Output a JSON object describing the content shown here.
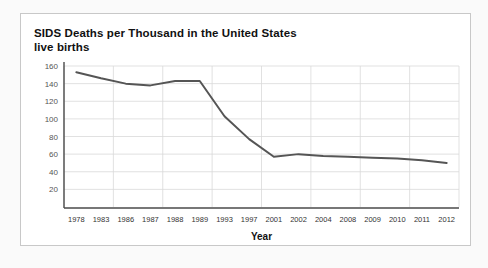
{
  "card": {
    "title_line1": "SIDS Deaths per Thousand in the United States",
    "title_line2": "live births",
    "border_color": "#c8c8c8",
    "background": "#ffffff"
  },
  "page": {
    "background": "#fafafa"
  },
  "chart_data": {
    "type": "line",
    "title": "SIDS Deaths per Thousand in the United States live births",
    "xlabel": "Year",
    "ylabel": "",
    "categories": [
      "1978",
      "1983",
      "1986",
      "1987",
      "1988",
      "1989",
      "1993",
      "1997",
      "2001",
      "2002",
      "2004",
      "2008",
      "2009",
      "2010",
      "2011",
      "2012"
    ],
    "values": [
      153,
      146,
      140,
      138,
      143,
      143,
      103,
      77,
      57,
      60,
      58,
      57,
      56,
      55,
      53,
      50
    ],
    "series": [
      {
        "name": "SIDS deaths per thousand live births",
        "values": [
          153,
          146,
          140,
          138,
          143,
          143,
          103,
          77,
          57,
          60,
          58,
          57,
          56,
          55,
          53,
          50
        ],
        "color": "#555555"
      }
    ],
    "ylim": [
      0,
      160
    ],
    "yticks": [
      20,
      40,
      60,
      80,
      100,
      120,
      140,
      160
    ],
    "ytick_labels": [
      "20",
      "40",
      "60",
      "80",
      "100",
      "120",
      "140",
      "160"
    ],
    "grid": true,
    "legend": "none"
  }
}
